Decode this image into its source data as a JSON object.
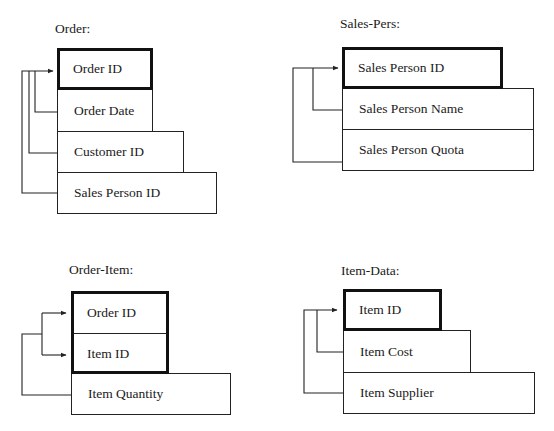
{
  "tables": [
    {
      "title": "Order:",
      "fields": [
        {
          "label": "Order ID",
          "primary_key": true
        },
        {
          "label": "Order Date",
          "primary_key": false
        },
        {
          "label": "Customer ID",
          "primary_key": false
        },
        {
          "label": "Sales Person ID",
          "primary_key": false
        }
      ]
    },
    {
      "title": "Sales-Pers:",
      "fields": [
        {
          "label": "Sales Person ID",
          "primary_key": true
        },
        {
          "label": "Sales Person Name",
          "primary_key": false
        },
        {
          "label": "Sales Person Quota",
          "primary_key": false
        }
      ]
    },
    {
      "title": "Order-Item:",
      "fields": [
        {
          "label": "Order ID",
          "primary_key": true
        },
        {
          "label": "Item ID",
          "primary_key": true
        },
        {
          "label": "Item Quantity",
          "primary_key": false
        }
      ]
    },
    {
      "title": "Item-Data:",
      "fields": [
        {
          "label": "Item ID",
          "primary_key": true
        },
        {
          "label": "Item Cost",
          "primary_key": false
        },
        {
          "label": "Item Supplier",
          "primary_key": false
        }
      ]
    }
  ],
  "colors": {
    "line": "#222222",
    "key_border": "#111111",
    "background": "#ffffff"
  }
}
